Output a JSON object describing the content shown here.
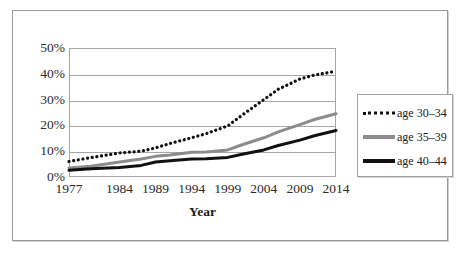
{
  "chart_data": {
    "type": "line",
    "title": "",
    "xlabel": "Year",
    "ylabel": "",
    "xlim": [
      1977,
      2014
    ],
    "ylim": [
      0,
      50
    ],
    "ytick_labels": [
      "50%",
      "40%",
      "30%",
      "20%",
      "10%",
      "0%"
    ],
    "ytick_values": [
      50,
      40,
      30,
      20,
      10,
      0
    ],
    "xtick_labels": [
      "1977",
      "1984",
      "1989",
      "1994",
      "1999",
      "2004",
      "2009",
      "2014"
    ],
    "xtick_values": [
      1977,
      1984,
      1989,
      1994,
      1999,
      2004,
      2009,
      2014
    ],
    "grid": "horizontal",
    "legend_position": "right-outside",
    "x": [
      1977,
      1980,
      1984,
      1987,
      1989,
      1991,
      1994,
      1996,
      1999,
      2001,
      2004,
      2006,
      2009,
      2011,
      2014
    ],
    "series": [
      {
        "name": "age 30-34",
        "style": "dotted",
        "color": "#111111",
        "values": [
          6.0,
          7.5,
          9.3,
          10.0,
          11.3,
          13.0,
          15.2,
          16.8,
          19.8,
          24.0,
          30.0,
          34.0,
          38.0,
          39.5,
          41.0
        ]
      },
      {
        "name": "age 35-39",
        "style": "solid",
        "color": "#8c8c8c",
        "values": [
          3.5,
          4.2,
          5.8,
          7.0,
          8.0,
          8.5,
          9.6,
          9.7,
          10.5,
          12.5,
          15.2,
          17.5,
          20.3,
          22.3,
          24.5
        ]
      },
      {
        "name": "age 40-44",
        "style": "solid",
        "color": "#111111",
        "values": [
          2.6,
          3.2,
          3.7,
          4.5,
          5.8,
          6.3,
          7.0,
          7.1,
          7.6,
          8.8,
          10.5,
          12.2,
          14.3,
          16.0,
          18.0
        ]
      }
    ],
    "legend": [
      {
        "label": "age 30-34",
        "swatch": "dotted-black-line-swatch"
      },
      {
        "label": "age 35-39",
        "swatch": "solid-gray-line-swatch"
      },
      {
        "label": "age 40-44",
        "swatch": "solid-black-line-swatch"
      }
    ],
    "colors": {
      "age_30_34": "#111111",
      "age_35_39": "#8c8c8c",
      "age_40_44": "#111111",
      "gridline": "#a6a6a6",
      "plot_border": "#a6a6a6",
      "figure_border": "#9a9a9a",
      "background": "#ffffff",
      "text": "#2b2b2b"
    }
  }
}
